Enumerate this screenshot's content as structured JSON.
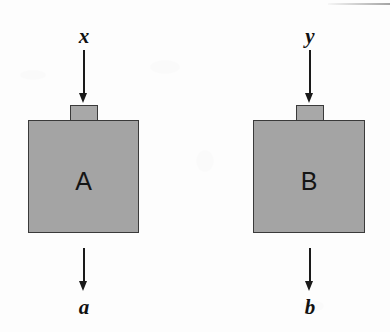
{
  "figure": {
    "type": "block-diagram",
    "background_color": "#fdfdfd",
    "block_fill_color": "#a4a4a4",
    "block_border_color": "#3a3a3a",
    "arrow_color": "#1a1a1a"
  },
  "blocks": [
    {
      "id": "A",
      "label": "A",
      "input_label": "x",
      "output_label": "b_unused",
      "output": "a"
    },
    {
      "id": "B",
      "label": "B",
      "input_label": "y",
      "output": "b"
    }
  ],
  "labels": {
    "block_a": "A",
    "block_b": "B",
    "input_a": "x",
    "input_b": "y",
    "output_a": "a",
    "output_b": "b"
  }
}
